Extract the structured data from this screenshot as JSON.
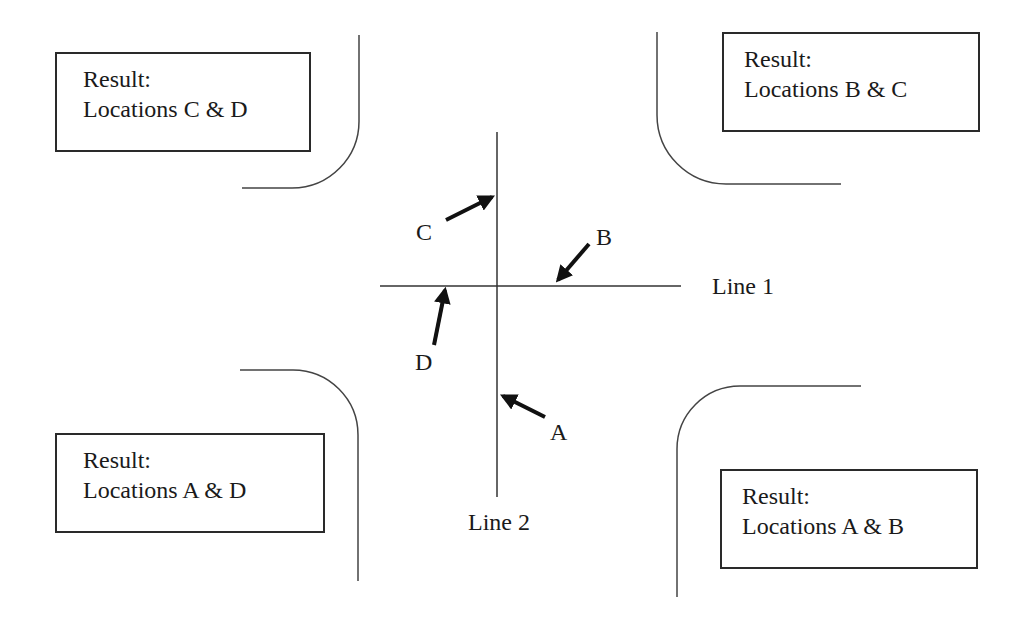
{
  "diagram": {
    "lines": {
      "line1": {
        "label": "Line 1",
        "orientation": "horizontal"
      },
      "line2": {
        "label": "Line 2",
        "orientation": "vertical"
      }
    },
    "locations": [
      {
        "id": "A",
        "label": "A"
      },
      {
        "id": "B",
        "label": "B"
      },
      {
        "id": "C",
        "label": "C"
      },
      {
        "id": "D",
        "label": "D"
      }
    ],
    "results": {
      "top_left": {
        "heading": "Result:",
        "text": "Locations C & D"
      },
      "top_right": {
        "heading": "Result:",
        "text": "Locations B & C"
      },
      "bottom_left": {
        "heading": "Result:",
        "text": "Locations A & D"
      },
      "bottom_right": {
        "heading": "Result:",
        "text": "Locations A & B"
      }
    },
    "colors": {
      "stroke": "#2a2a2a",
      "background": "#ffffff"
    }
  }
}
